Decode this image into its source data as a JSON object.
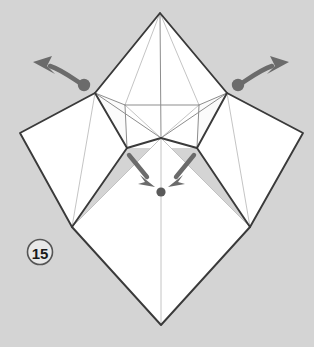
{
  "diagram": {
    "step_label": "15",
    "canvas": {
      "width": 314,
      "height": 347
    },
    "colors": {
      "background": "#d4d4d4",
      "paper_fill": "#ffffff",
      "paper_fill_shade": "#fafafa",
      "outline": "#3a3a3a",
      "crease_major": "#6e6e6e",
      "crease_minor": "#b4b4b4",
      "arrow": "#6b6b6b",
      "step_circle_stroke": "#555555",
      "step_text": "#1a1a1a"
    },
    "points": {
      "top_apex": [
        160,
        13
      ],
      "left_outer": [
        20,
        133
      ],
      "right_outer": [
        303,
        133
      ],
      "bottom_apex": [
        161,
        325
      ],
      "left_shoulder": [
        95,
        93
      ],
      "right_shoulder": [
        227,
        93
      ],
      "left_lower": [
        72,
        227
      ],
      "right_lower": [
        250,
        227
      ],
      "center_node": [
        161,
        138
      ],
      "inner_left": [
        125,
        105
      ],
      "inner_right": [
        199,
        105
      ],
      "inner_low_left": [
        127,
        148
      ],
      "inner_low_right": [
        197,
        148
      ],
      "target_dot": [
        161,
        192
      ]
    },
    "arrows": [
      {
        "name": "left-unfold-arrow",
        "description": "curved arrow pulling left flap outward to the upper left",
        "dot": [
          84,
          85
        ],
        "tip": [
          33,
          62
        ],
        "direction": "left-up"
      },
      {
        "name": "right-unfold-arrow",
        "description": "curved arrow pulling right flap outward to the upper right",
        "dot": [
          238,
          85
        ],
        "tip": [
          289,
          62
        ],
        "direction": "right-up"
      },
      {
        "name": "center-left-push-arrow",
        "description": "straight arrow pushing down-right toward centre dot",
        "from": [
          131,
          156
        ],
        "tip": [
          153,
          186
        ],
        "direction": "down-right"
      },
      {
        "name": "center-right-push-arrow",
        "description": "straight arrow pushing down-left toward centre dot",
        "from": [
          193,
          156
        ],
        "tip": [
          170,
          186
        ],
        "direction": "down-left"
      }
    ]
  }
}
